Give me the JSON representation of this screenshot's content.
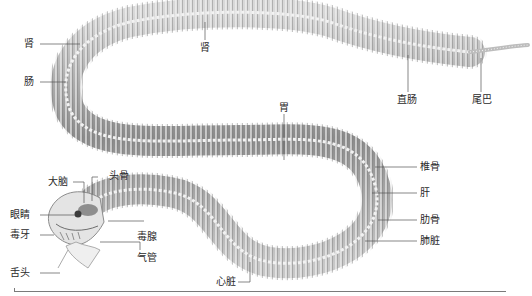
{
  "diagram": {
    "colors": {
      "bone": "#e8e8e8",
      "bone_shadow": "#9a9a9a",
      "body_dark": "#6e6e6e",
      "leader": "#555555",
      "text": "#2a2a2a"
    },
    "labels": {
      "kidney_left": "肾",
      "intestine": "肠",
      "kidney_mid": "肾",
      "rectum": "直肠",
      "tail": "尾巴",
      "stomach": "胃",
      "vertebra": "椎骨",
      "liver": "肝",
      "rib": "肋骨",
      "lung": "肺脏",
      "heart": "心脏",
      "brain": "大脑",
      "skull": "头骨",
      "eye": "眼睛",
      "fang": "毒牙",
      "venom_gland": "毒腺",
      "trachea": "气管",
      "tongue": "舌头"
    }
  }
}
